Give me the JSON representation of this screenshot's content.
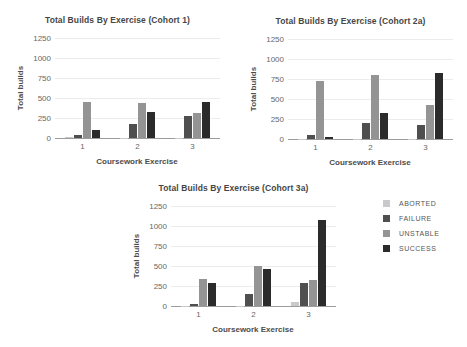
{
  "figure": {
    "background": "#ffffff",
    "grid_color": "#ececec",
    "axis_color": "#9c9c9c",
    "text_color": "#4c4c4c"
  },
  "legend": {
    "position": "right",
    "items": [
      {
        "label": "ABORTED",
        "color": "#c9c9c9"
      },
      {
        "label": "FAILURE",
        "color": "#4f4f4f"
      },
      {
        "label": "UNSTABLE",
        "color": "#949494"
      },
      {
        "label": "SUCCESS",
        "color": "#2b2b2b"
      }
    ]
  },
  "chart_data": [
    {
      "type": "bar",
      "title": "Total Builds By Exercise (Cohort 1)",
      "xlabel": "Coursework Exercise",
      "ylabel": "Total builds",
      "ylim": [
        0,
        1250
      ],
      "yticks": [
        0,
        250,
        500,
        750,
        1000,
        1250
      ],
      "grid": true,
      "categories": [
        "1",
        "2",
        "3"
      ],
      "series": [
        {
          "name": "ABORTED",
          "values": [
            10,
            5,
            5
          ]
        },
        {
          "name": "FAILURE",
          "values": [
            40,
            180,
            270
          ]
        },
        {
          "name": "UNSTABLE",
          "values": [
            450,
            440,
            310
          ]
        },
        {
          "name": "SUCCESS",
          "values": [
            100,
            320,
            450
          ]
        }
      ]
    },
    {
      "type": "bar",
      "title": "Total Builds By Exercise (Cohort 2a)",
      "xlabel": "Coursework Exercise",
      "ylabel": "Total builds",
      "ylim": [
        0,
        1250
      ],
      "yticks": [
        0,
        250,
        500,
        750,
        1000,
        1250
      ],
      "grid": true,
      "categories": [
        "1",
        "2",
        "3"
      ],
      "series": [
        {
          "name": "ABORTED",
          "values": [
            5,
            5,
            5
          ]
        },
        {
          "name": "FAILURE",
          "values": [
            55,
            200,
            170
          ]
        },
        {
          "name": "UNSTABLE",
          "values": [
            725,
            800,
            430
          ]
        },
        {
          "name": "SUCCESS",
          "values": [
            25,
            325,
            820
          ]
        }
      ]
    },
    {
      "type": "bar",
      "title": "Total Builds By Exercise (Cohort 3a)",
      "xlabel": "Coursework Exercise",
      "ylabel": "Total builds",
      "ylim": [
        0,
        1250
      ],
      "yticks": [
        0,
        250,
        500,
        750,
        1000,
        1250
      ],
      "grid": true,
      "categories": [
        "1",
        "2",
        "3"
      ],
      "series": [
        {
          "name": "ABORTED",
          "values": [
            5,
            5,
            50
          ]
        },
        {
          "name": "FAILURE",
          "values": [
            30,
            155,
            285
          ]
        },
        {
          "name": "UNSTABLE",
          "values": [
            340,
            500,
            320
          ]
        },
        {
          "name": "SUCCESS",
          "values": [
            290,
            460,
            1080
          ]
        }
      ]
    }
  ]
}
